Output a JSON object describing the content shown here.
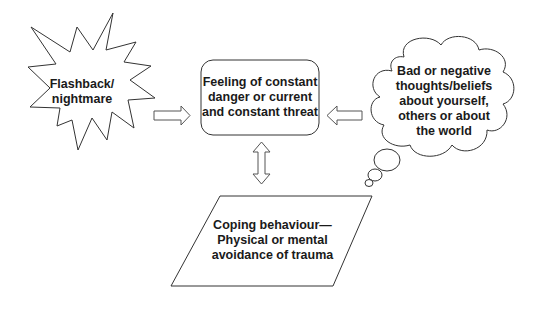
{
  "diagram": {
    "nodes": {
      "flashback": {
        "shape": "starburst",
        "text": "Flashback/\nnightmare"
      },
      "feeling": {
        "shape": "rounded-rectangle",
        "text": "Feeling of constant\ndanger or current\nand constant threat"
      },
      "thoughts": {
        "shape": "thought-cloud",
        "text": "Bad or negative\nthoughts/beliefs\nabout yourself,\nothers or about\nthe world"
      },
      "coping": {
        "shape": "parallelogram",
        "text": "Coping behaviour—\nPhysical or mental\navoidance of trauma"
      }
    },
    "edges": [
      {
        "from": "flashback",
        "to": "feeling",
        "type": "block-arrow-right"
      },
      {
        "from": "thoughts",
        "to": "feeling",
        "type": "block-arrow-left"
      },
      {
        "from": "feeling",
        "to": "coping",
        "type": "block-arrow-bidirectional-vertical"
      }
    ]
  },
  "colors": {
    "stroke": "#333333",
    "fill": "#ffffff",
    "text": "#1a1a1a",
    "background": "#ffffff"
  }
}
